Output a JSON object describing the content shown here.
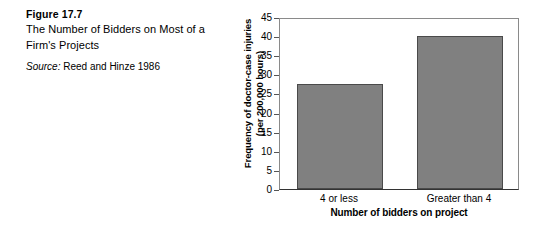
{
  "caption": {
    "figure_number": "Figure 17.7",
    "title": "The Number of Bidders on Most of a Firm's Projects",
    "source_label": "Source:",
    "source_text": "Reed and Hinze 1986"
  },
  "colors": {
    "bar_fill": "#808080",
    "bar_stroke": "#4a4a4a",
    "frame": "#8a8a8a",
    "axis": "#333333",
    "background": "#ffffff",
    "text": "#000000"
  },
  "chart_data": {
    "type": "bar",
    "title": "",
    "categories": [
      "4 or less",
      "Greater than 4"
    ],
    "values": [
      27.5,
      40
    ],
    "series": [
      {
        "name": "Frequency of doctor-case injuries (per 200,000 hours)",
        "values": [
          27.5,
          40
        ]
      }
    ],
    "xlabel": "Number of bidders on project",
    "ylabel": "Frequency of doctor-case injuries (per 200,000 hours)",
    "ylabel_line1": "Frequency of doctor-case injuries",
    "ylabel_line2": "(per 200,000 hours)",
    "ylim": [
      0,
      45
    ],
    "ytick_step": 5,
    "yticks": [
      45,
      40,
      35,
      30,
      25,
      20,
      15,
      10,
      5,
      0
    ],
    "ytick_labels": [
      "45",
      "40",
      "35",
      "30",
      "25",
      "20",
      "15",
      "10",
      "5",
      "0"
    ],
    "grid": false,
    "legend": false,
    "legend_position": "none"
  }
}
